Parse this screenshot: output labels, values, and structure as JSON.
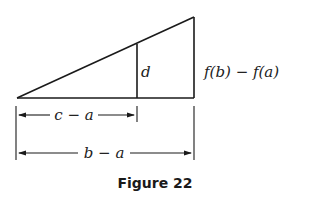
{
  "figure": {
    "caption": "Figure 22",
    "labels": {
      "inner_height": "d",
      "outer_height": "f(b) − f(a)",
      "short_span": "c − a",
      "long_span": "b − a"
    },
    "stroke_color": "#1a1a1a"
  }
}
